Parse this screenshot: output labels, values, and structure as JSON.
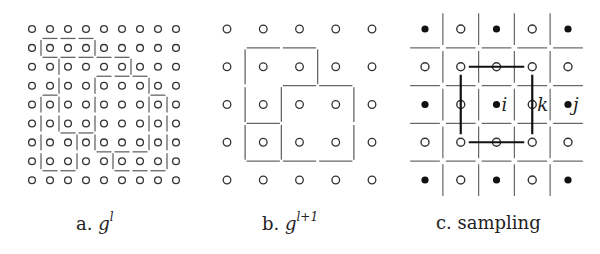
{
  "figure": {
    "panels": [
      {
        "id": "a",
        "caption_prefix": "a.",
        "caption_symbol": "g",
        "caption_superscript": "l",
        "grid": {
          "cols": 9,
          "rows": 9,
          "x0": 32,
          "dx": 18,
          "y0": 29,
          "dy": 18.9
        },
        "v_edges": [
          [
            1,
            1
          ],
          [
            1,
            4
          ],
          [
            2,
            2
          ],
          [
            2,
            6
          ],
          [
            3,
            2
          ],
          [
            3,
            4
          ],
          [
            3,
            7
          ],
          [
            4,
            1
          ],
          [
            4,
            2
          ],
          [
            4,
            4
          ],
          [
            4,
            7
          ],
          [
            4,
            8
          ],
          [
            5,
            1
          ],
          [
            5,
            2
          ],
          [
            5,
            4
          ],
          [
            5,
            7
          ],
          [
            5,
            8
          ],
          [
            6,
            1
          ],
          [
            6,
            3
          ],
          [
            6,
            4
          ],
          [
            6,
            7
          ],
          [
            6,
            8
          ],
          [
            7,
            1
          ],
          [
            7,
            3
          ],
          [
            7,
            5
          ],
          [
            7,
            8
          ]
        ],
        "h_edges": [
          [
            1,
            1
          ],
          [
            1,
            2
          ],
          [
            1,
            3
          ],
          [
            2,
            1
          ],
          [
            2,
            2
          ],
          [
            2,
            3
          ],
          [
            2,
            4
          ],
          [
            2,
            5
          ],
          [
            3,
            4
          ],
          [
            3,
            5
          ],
          [
            3,
            6
          ],
          [
            4,
            1
          ],
          [
            4,
            7
          ],
          [
            6,
            2
          ],
          [
            6,
            3
          ],
          [
            7,
            4
          ],
          [
            7,
            5
          ],
          [
            7,
            6
          ],
          [
            8,
            1
          ],
          [
            8,
            2
          ],
          [
            8,
            5
          ],
          [
            8,
            6
          ],
          [
            8,
            7
          ]
        ]
      },
      {
        "id": "b",
        "caption_prefix": "b.",
        "caption_symbol": "g",
        "caption_superscript": "l+1",
        "grid": {
          "cols": 5,
          "rows": 5,
          "x0": 227,
          "dx": 36.25,
          "y0": 29,
          "dy": 37.75
        },
        "v_edges": [
          [
            1,
            1
          ],
          [
            1,
            3
          ],
          [
            2,
            1
          ],
          [
            2,
            2
          ],
          [
            2,
            4
          ],
          [
            3,
            1
          ],
          [
            3,
            2
          ],
          [
            3,
            4
          ]
        ],
        "h_edges": [
          [
            1,
            1
          ],
          [
            1,
            2
          ],
          [
            2,
            2
          ],
          [
            2,
            3
          ],
          [
            3,
            1
          ],
          [
            4,
            1
          ],
          [
            4,
            2
          ],
          [
            4,
            3
          ]
        ]
      },
      {
        "id": "c",
        "caption_prefix": "c.",
        "caption_text": "sampling",
        "grid": {
          "cols": 5,
          "rows": 5,
          "x0": 425,
          "dx": 35.75,
          "y0": 29,
          "dy": 37.75
        },
        "filled": [
          [
            0,
            0
          ],
          [
            0,
            2
          ],
          [
            0,
            4
          ],
          [
            2,
            0
          ],
          [
            2,
            2
          ],
          [
            2,
            4
          ],
          [
            4,
            0
          ],
          [
            4,
            2
          ],
          [
            4,
            4
          ]
        ],
        "labels": [
          {
            "text": "i",
            "row": 2,
            "col": 2
          },
          {
            "text": "k",
            "row": 2,
            "col": 3
          },
          {
            "text": "j",
            "row": 2,
            "col": 4
          }
        ],
        "box": {
          "row0": 1,
          "col0": 1,
          "row1": 3,
          "col1": 3
        }
      }
    ]
  },
  "colors": {
    "dot": "#333333",
    "edge": "#666666",
    "box": "#111111",
    "text": "#222222"
  }
}
